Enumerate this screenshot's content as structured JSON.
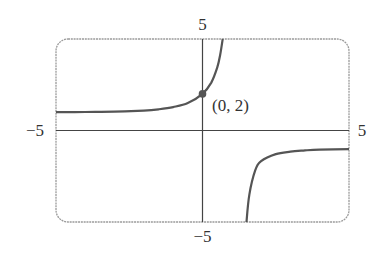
{
  "chart_data": {
    "type": "line",
    "title": "",
    "xlabel": "",
    "ylabel": "",
    "xlim": [
      -5,
      5
    ],
    "ylim": [
      -5,
      5
    ],
    "grid": false,
    "tick_labels": {
      "x_min": "−5",
      "x_max": "5",
      "y_min": "−5",
      "y_max": "5"
    },
    "series": [
      {
        "name": "f(x)",
        "description": "Rational-exponential curve with vertical asymptote near x = ln 3 (~1.1), horizontal asymptotes y = 1 (left) and y = -1 (right)",
        "branches": [
          {
            "x": [
              -5,
              -4,
              -3,
              -2,
              -1.5,
              -1,
              -0.5,
              0,
              0.3,
              0.5,
              0.6,
              0.69
            ],
            "y": [
              1.0,
              1.01,
              1.03,
              1.09,
              1.16,
              1.28,
              1.5,
              2.0,
              2.62,
              3.43,
              4.11,
              5.0
            ]
          },
          {
            "x": [
              1.5,
              1.6,
              1.8,
              2.0,
              2.5,
              3.0,
              3.5,
              4.0,
              5.0
            ],
            "y": [
              -5.0,
              -3.49,
              -2.18,
              -1.68,
              -1.29,
              -1.16,
              -1.09,
              -1.05,
              -1.02
            ]
          }
        ]
      }
    ],
    "annotations": [
      {
        "type": "point",
        "x": 0,
        "y": 2,
        "label": "(0, 2)"
      }
    ],
    "colors": {
      "curve": "#555555",
      "axes": "#444444",
      "frame": "#9a9a9a",
      "point": "#555555"
    }
  }
}
